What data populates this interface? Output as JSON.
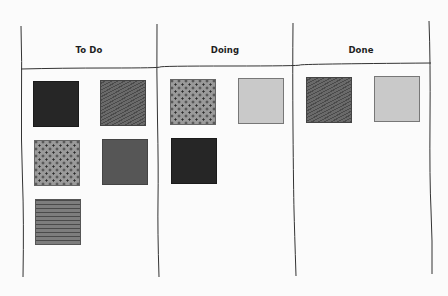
{
  "board": {
    "type": "kanban",
    "columns": [
      {
        "id": "todo",
        "title": "To Do",
        "cards": [
          {
            "fill": "solid-black",
            "color": "#262626"
          },
          {
            "fill": "hatch-diagonal",
            "color": "#5a5a5a"
          },
          {
            "fill": "dotted",
            "color": "#9a9a9a"
          },
          {
            "fill": "solid-dark",
            "color": "#565656"
          },
          {
            "fill": "stripes-horizontal",
            "color": "#7d7d7d"
          }
        ]
      },
      {
        "id": "doing",
        "title": "Doing",
        "cards": [
          {
            "fill": "dotted",
            "color": "#9a9a9a"
          },
          {
            "fill": "solid-light",
            "color": "#c9c9c9"
          },
          {
            "fill": "solid-black",
            "color": "#262626"
          }
        ]
      },
      {
        "id": "done",
        "title": "Done",
        "cards": [
          {
            "fill": "hatch-diagonal",
            "color": "#5a5a5a"
          },
          {
            "fill": "solid-light",
            "color": "#c9c9c9"
          }
        ]
      }
    ]
  },
  "colors": {
    "background": "#fbfbfb",
    "line": "#333333",
    "text": "#1e1e1e"
  }
}
